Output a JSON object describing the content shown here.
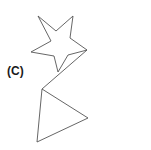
{
  "panel": {
    "label": "(C)",
    "background_color": "#ffffff",
    "width": 151,
    "height": 150
  },
  "style": {
    "stroke_color": "#555555",
    "stroke_width": 0.9,
    "fill": "none",
    "label_color": "#1a1a1a"
  },
  "figure": {
    "caption": "(C)",
    "shapes": [
      {
        "name": "star",
        "type": "polygon",
        "point_count": 5,
        "points": "38,16 51,41 31,52 54,56 58,72 68,55 87,50 70,38 73,16 56,31",
        "bounding_box": {
          "x": 31,
          "y": 16,
          "width": 56,
          "height": 56
        }
      },
      {
        "name": "triangle",
        "type": "polygon",
        "point_count": 3,
        "points": "42,89 88,118 37,142",
        "bounding_box": {
          "x": 37,
          "y": 89,
          "width": 51,
          "height": 53
        }
      },
      {
        "name": "connector",
        "type": "line",
        "from": "87,50",
        "to": "42,89"
      }
    ]
  }
}
